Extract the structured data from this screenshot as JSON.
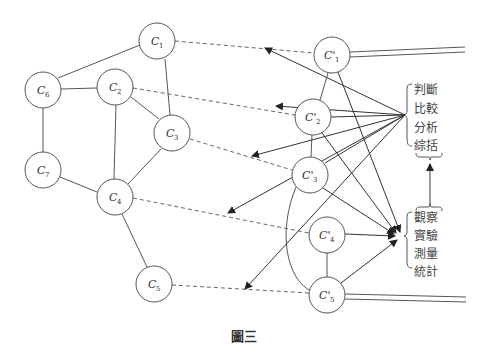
{
  "figure": {
    "caption": "圖三",
    "left_graph": {
      "nodes": [
        {
          "id": "C1",
          "base": "C",
          "sub": "1",
          "x": 157,
          "y": 41
        },
        {
          "id": "C2",
          "base": "C",
          "sub": "2",
          "x": 115,
          "y": 87
        },
        {
          "id": "C3",
          "base": "C",
          "sub": "3",
          "x": 172,
          "y": 133
        },
        {
          "id": "C4",
          "base": "C",
          "sub": "4",
          "x": 115,
          "y": 197
        },
        {
          "id": "C5",
          "base": "C",
          "sub": "5",
          "x": 154,
          "y": 284
        },
        {
          "id": "C6",
          "base": "C",
          "sub": "6",
          "x": 43,
          "y": 90
        },
        {
          "id": "C7",
          "base": "C",
          "sub": "7",
          "x": 43,
          "y": 170
        }
      ],
      "edges": [
        [
          "C1",
          "C6"
        ],
        [
          "C1",
          "C3"
        ],
        [
          "C6",
          "C2"
        ],
        [
          "C6",
          "C7"
        ],
        [
          "C2",
          "C3"
        ],
        [
          "C2",
          "C4"
        ],
        [
          "C3",
          "C4"
        ],
        [
          "C7",
          "C4"
        ],
        [
          "C4",
          "C5"
        ]
      ]
    },
    "right_graph": {
      "nodes": [
        {
          "id": "C'1",
          "base": "C'",
          "sub": "1",
          "x": 332,
          "y": 55
        },
        {
          "id": "C'2",
          "base": "C'",
          "sub": "2",
          "x": 313,
          "y": 117
        },
        {
          "id": "C'3",
          "base": "C'",
          "sub": "3",
          "x": 310,
          "y": 175
        },
        {
          "id": "C'4",
          "base": "C'",
          "sub": "4",
          "x": 327,
          "y": 235
        },
        {
          "id": "C'5",
          "base": "C'",
          "sub": "5",
          "x": 327,
          "y": 295
        }
      ],
      "edges": [
        [
          "C'1",
          "C'2"
        ],
        [
          "C'2",
          "C'3"
        ],
        [
          "C'4",
          "C'5"
        ]
      ]
    },
    "correspondences": [
      [
        "C1",
        "C'1"
      ],
      [
        "C2",
        "C'2"
      ],
      [
        "C3",
        "C'3"
      ],
      [
        "C4",
        "C'4"
      ],
      [
        "C5",
        "C'5"
      ]
    ],
    "judgment_box": {
      "lines": [
        "判斷",
        "比較",
        "分析",
        "綜括"
      ]
    },
    "observation_box": {
      "lines": [
        "觀察",
        "實驗",
        "測量",
        "統計"
      ]
    }
  }
}
